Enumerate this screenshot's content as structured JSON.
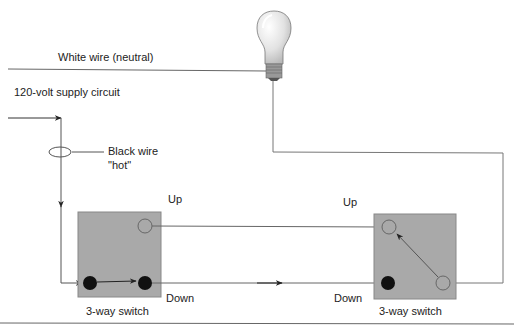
{
  "labels": {
    "white_wire": "White wire (neutral)",
    "supply": "120-volt supply circuit",
    "black_wire_line1": "Black wire",
    "black_wire_line2": "\"hot\"",
    "left_up": "Up",
    "left_down": "Down",
    "left_switch": "3-way switch",
    "right_up": "Up",
    "right_down": "Down",
    "right_switch": "3-way switch"
  },
  "colors": {
    "wire": "#555555",
    "switch_fill": "#a9a9a9",
    "terminal_active": "#111111",
    "bulb_glass": "#e4e4e4",
    "text": "#222222"
  },
  "icons": {
    "bulb": "light-bulb-icon",
    "terminal_filled": "filled-terminal-icon",
    "terminal_open": "open-terminal-icon"
  }
}
